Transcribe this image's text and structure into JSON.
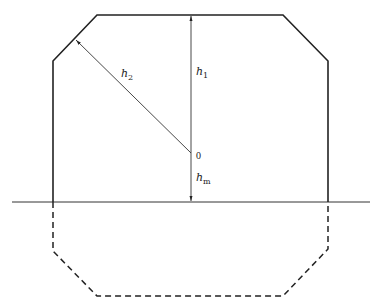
{
  "diagram": {
    "type": "cross-section",
    "colors": {
      "stroke": "#222222",
      "background": "#ffffff"
    },
    "labels": {
      "h1": {
        "base": "h",
        "sub": "1"
      },
      "h2": {
        "base": "h",
        "sub": "2"
      },
      "hm": {
        "base": "h",
        "sub": "m"
      },
      "origin": "0"
    },
    "geometry": {
      "solid_outline": [
        [
          53,
          202
        ],
        [
          53,
          61
        ],
        [
          97,
          15
        ],
        [
          283,
          15
        ],
        [
          328,
          61
        ],
        [
          328,
          202
        ]
      ],
      "dashed_outline": [
        [
          53,
          202
        ],
        [
          53,
          251
        ],
        [
          97,
          296
        ],
        [
          283,
          296
        ],
        [
          328,
          249
        ],
        [
          328,
          202
        ]
      ],
      "ground_line": [
        [
          12,
          202
        ],
        [
          370,
          202
        ]
      ],
      "origin_point": [
        191,
        153
      ],
      "h1_arrow": {
        "from": [
          191,
          153
        ],
        "to": [
          191,
          15
        ]
      },
      "h2_arrow": {
        "from": [
          191,
          153
        ],
        "to": [
          75,
          39
        ]
      },
      "hm_arrow": {
        "from": [
          191,
          153
        ],
        "to": [
          191,
          202
        ]
      }
    }
  }
}
